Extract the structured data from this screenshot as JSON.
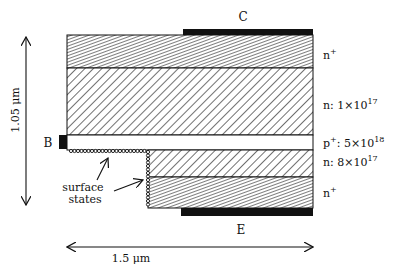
{
  "diagram": {
    "terminals": {
      "collector": "C",
      "emitter": "E",
      "base": "B"
    },
    "layers": [
      {
        "name": "n+ collector contact layer",
        "label": "n",
        "sup": "+",
        "suffix": ""
      },
      {
        "name": "n collector",
        "label": "n: 1×10",
        "sup": "17",
        "suffix": ""
      },
      {
        "name": "p+ base",
        "label": "p",
        "sup": "+",
        "suffix": ": 5×10",
        "sup2": "18"
      },
      {
        "name": "n emitter",
        "label": "n: 8×10",
        "sup": "17",
        "suffix": ""
      },
      {
        "name": "n+ emitter contact layer",
        "label": "n",
        "sup": "+",
        "suffix": ""
      }
    ],
    "annotation": {
      "line1": "surface",
      "line2": "states"
    },
    "dimensions": {
      "height": "1.05 μm",
      "width": "1.5 μm"
    },
    "colors": {
      "ink": "#111111",
      "background": "#ffffff"
    }
  }
}
